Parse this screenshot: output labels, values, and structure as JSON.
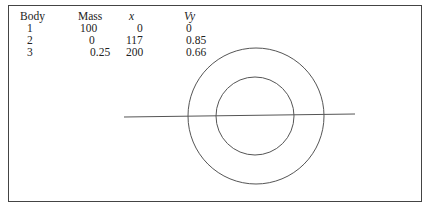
{
  "table": {
    "headers": [
      "Body",
      "Mass",
      "x",
      "Vy"
    ],
    "rows": [
      [
        "1",
        "100",
        "0",
        "0"
      ],
      [
        "2",
        "0",
        "117",
        "0.85"
      ],
      [
        "3",
        "0.25",
        "200",
        "0.66"
      ]
    ]
  },
  "diagram": {
    "outer_circle": {
      "cx": 256,
      "cy": 116,
      "r": 68
    },
    "inner_circle": {
      "cx": 255,
      "cy": 116,
      "r": 39
    },
    "line": {
      "x1": 124,
      "y1": 117,
      "x2": 355,
      "y2": 114
    },
    "stroke": "#555555"
  }
}
